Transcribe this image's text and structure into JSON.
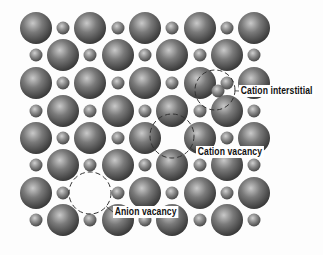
{
  "diagram": {
    "colors": {
      "background": "#fdfdfd",
      "sphere_light": "#c9c9c9",
      "sphere_mid": "#7a7a7a",
      "sphere_dark": "#3a3a3a",
      "dashed_circle": "#333333"
    },
    "lattice": {
      "columns_x": [
        36,
        63,
        90,
        118,
        145,
        172,
        200,
        227,
        254
      ],
      "rows_y": [
        28,
        55,
        83,
        111,
        138,
        165,
        193,
        220
      ],
      "large_radius": 16,
      "small_radius": 6.5,
      "pattern": "checkerboard: large where (row+col) even, small where odd",
      "missing_sites": [
        {
          "row": 4,
          "col": 5,
          "type": "small",
          "defect": "Cation vacancy"
        },
        {
          "row": 6,
          "col": 2,
          "type": "large",
          "defect": "Anion vacancy"
        }
      ],
      "extra_sites": [
        {
          "x": 218,
          "y": 91,
          "type": "small",
          "defect": "Cation interstitial"
        }
      ]
    },
    "defects": [
      {
        "id": "cation-interstitial",
        "label": "Cation interstitial",
        "circle": {
          "cx": 215,
          "cy": 90,
          "r": 20
        },
        "label_x": 239,
        "label_y": 85
      },
      {
        "id": "cation-vacancy",
        "label": "Cation vacancy",
        "circle": {
          "cx": 172,
          "cy": 136,
          "r": 22
        },
        "label_x": 196,
        "label_y": 146
      },
      {
        "id": "anion-vacancy",
        "label": "Anion vacancy",
        "circle": {
          "cx": 90,
          "cy": 193,
          "r": 21
        },
        "label_x": 113,
        "label_y": 206
      }
    ]
  }
}
